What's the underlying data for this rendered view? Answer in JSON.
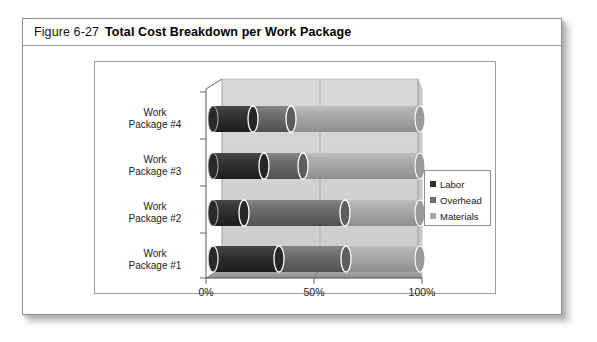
{
  "figure": {
    "number": "Figure 6-27",
    "title": "Total Cost Breakdown per Work Package"
  },
  "legend": {
    "position": "right-middle",
    "items": [
      {
        "label": "Labor",
        "color": "#2f2f2f"
      },
      {
        "label": "Overhead",
        "color": "#6b6b6b"
      },
      {
        "label": "Materials",
        "color": "#a8a8a8"
      }
    ]
  },
  "axis": {
    "x_ticks": [
      "0%",
      "50%",
      "100%"
    ],
    "x_values": [
      0,
      50,
      100
    ]
  },
  "colors": {
    "labor": "#2f2f2f",
    "overhead": "#6b6b6b",
    "materials": "#a8a8a8",
    "plot_wall": "#d2d2d2",
    "plot_floor": "#9f9f9f",
    "frame": "#8d8d8d",
    "background": "#ffffff"
  },
  "chart_data": {
    "type": "bar",
    "orientation": "horizontal",
    "stacked": true,
    "style": "3d-cylinder",
    "title": "Total Cost Breakdown per Work Package",
    "xlabel": "",
    "ylabel": "",
    "xlim": [
      0,
      100
    ],
    "xticks": [
      0,
      50,
      100
    ],
    "xticklabels": [
      "0%",
      "50%",
      "100%"
    ],
    "grid": false,
    "legend_position": "right",
    "categories": [
      "Work Package #1",
      "Work Package #2",
      "Work Package #3",
      "Work Package #4"
    ],
    "series": [
      {
        "name": "Labor",
        "color": "#2f2f2f",
        "values": [
          51,
          33,
          44,
          39
        ]
      },
      {
        "name": "Overhead",
        "color": "#6b6b6b",
        "values": [
          27,
          47,
          21,
          20
        ]
      },
      {
        "name": "Materials",
        "color": "#a8a8a8",
        "values": [
          22,
          20,
          35,
          41
        ]
      }
    ],
    "totals": [
      100,
      100,
      100,
      100
    ],
    "units": "percent"
  }
}
